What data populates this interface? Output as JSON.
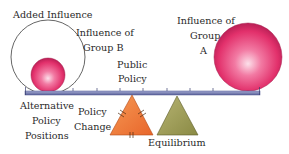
{
  "labels": {
    "added_influence": "Added Influence",
    "influence_group_b_line1": "Influence of",
    "influence_group_b_line2": "Group B",
    "public_policy_line1": "Public",
    "public_policy_line2": "Policy",
    "influence_group_a_line1": "Influence of",
    "influence_group_a_line2": "Group",
    "influence_group_a_line3": "A",
    "alternative_line1": "Alternative",
    "alternative_line2": "Policy",
    "alternative_line3": "Positions",
    "policy_change_line1": "Policy",
    "policy_change_line2": "Change",
    "equilibrium": "Equilibrium"
  },
  "colors": {
    "sphere_pink": "#e8306e",
    "sphere_highlight": "#fbd1e0",
    "beam": "#7f86b8",
    "beam_dark": "#4d5590",
    "orange_triangle": "#f07a3a",
    "olive_triangle": "#9c9b55",
    "outline": "#555555"
  }
}
